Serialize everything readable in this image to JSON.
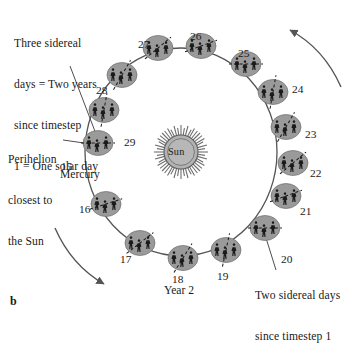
{
  "figure": {
    "panel_letter": "b",
    "background_color": "#ffffff",
    "ink_color": "#1a1a1a",
    "planet_fill": "#9a9a9a",
    "sun_fill": "#b2b2b2",
    "orbit_stroke": "#555555"
  },
  "annotations": {
    "top_left": {
      "name": "three-sidereal-days-note",
      "lines": [
        "Three sidereal",
        "days = Two years",
        "since timestep",
        "1 = One solar day"
      ],
      "text": "Three sidereal days = Two years since timestep 1 = One solar day",
      "points_to": "15"
    },
    "perihelion": {
      "name": "perihelion-note",
      "lines": [
        "Perihelion",
        "closest to",
        "the Sun"
      ],
      "text": "Perihelion closest to the Sun",
      "points_to": "15"
    },
    "bottom_right": {
      "name": "two-sidereal-days-note",
      "lines": [
        "Two sidereal days",
        "since timestep 1"
      ],
      "text": "Two sidereal days since timestep 1",
      "points_to": "20"
    },
    "year_label": "Year 2",
    "body_label": "Mercury",
    "sun_label": "Sun"
  },
  "chart_data": {
    "type": "diagram",
    "center_body": "Sun",
    "orbiting_body": "Mercury",
    "orbit_direction": "counterclockwise",
    "timestep_range": [
      15,
      29
    ],
    "positions": [
      {
        "label": "15",
        "x": 98,
        "y": 143,
        "angle_deg": 180,
        "number_x": 61,
        "number_y": 160,
        "axis_deg": 0,
        "perihelion": true
      },
      {
        "label": "16",
        "x": 106,
        "y": 204,
        "angle_deg": 215,
        "number_x": 79,
        "number_y": 203,
        "axis_deg": -18
      },
      {
        "label": "17",
        "x": 140,
        "y": 243,
        "angle_deg": 243,
        "number_x": 120,
        "number_y": 253,
        "axis_deg": -38
      },
      {
        "label": "18",
        "x": 183,
        "y": 258,
        "angle_deg": 268,
        "number_x": 172,
        "number_y": 273,
        "axis_deg": -58
      },
      {
        "label": "19",
        "x": 226,
        "y": 250,
        "angle_deg": 292,
        "number_x": 217,
        "number_y": 270,
        "axis_deg": -78
      },
      {
        "label": "20",
        "x": 265,
        "y": 228,
        "angle_deg": 313,
        "number_x": 281,
        "number_y": 253,
        "axis_deg": 0
      },
      {
        "label": "21",
        "x": 286,
        "y": 196,
        "angle_deg": 333,
        "number_x": 300,
        "number_y": 205,
        "axis_deg": -20
      },
      {
        "label": "22",
        "x": 293,
        "y": 163,
        "angle_deg": 350,
        "number_x": 310,
        "number_y": 167,
        "axis_deg": -40
      },
      {
        "label": "23",
        "x": 286,
        "y": 127,
        "angle_deg": 10,
        "number_x": 305,
        "number_y": 128,
        "axis_deg": -60
      },
      {
        "label": "24",
        "x": 273,
        "y": 92,
        "angle_deg": 28,
        "number_x": 292,
        "number_y": 83,
        "axis_deg": -80
      },
      {
        "label": "25",
        "x": 246,
        "y": 64,
        "angle_deg": 48,
        "number_x": 238,
        "number_y": 47,
        "axis_deg": 0
      },
      {
        "label": "26",
        "x": 201,
        "y": 46,
        "angle_deg": 72,
        "number_x": 190,
        "number_y": 30,
        "axis_deg": -20
      },
      {
        "label": "27",
        "x": 158,
        "y": 48,
        "angle_deg": 98,
        "number_x": 138,
        "number_y": 38,
        "axis_deg": -40
      },
      {
        "label": "28",
        "x": 122,
        "y": 75,
        "angle_deg": 126,
        "number_x": 96,
        "number_y": 84,
        "axis_deg": -60
      },
      {
        "label": "29",
        "x": 104,
        "y": 110,
        "angle_deg": 152,
        "number_x": 124,
        "number_y": 136,
        "axis_deg": -80
      }
    ],
    "sun": {
      "x": 181,
      "y": 152,
      "radius": 18
    },
    "direction_arrows": [
      {
        "name": "orbit-arrow-top-right",
        "description": "counterclockwise arrow, upper right"
      },
      {
        "name": "orbit-arrow-bottom-left",
        "description": "counterclockwise arrow, lower left"
      }
    ]
  }
}
